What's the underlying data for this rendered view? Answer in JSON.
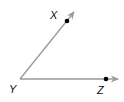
{
  "diagram": {
    "type": "angle",
    "vertex": {
      "label": "Y",
      "x": 20,
      "y": 79
    },
    "points": [
      {
        "label": "X",
        "x": 67,
        "y": 21
      },
      {
        "label": "Z",
        "x": 106,
        "y": 79
      }
    ],
    "rays": [
      {
        "from": "Y",
        "through": "X"
      },
      {
        "from": "Y",
        "through": "Z"
      }
    ],
    "colors": {
      "ray": "#9a9a9a",
      "point": "#000000",
      "label": "#111111"
    }
  }
}
